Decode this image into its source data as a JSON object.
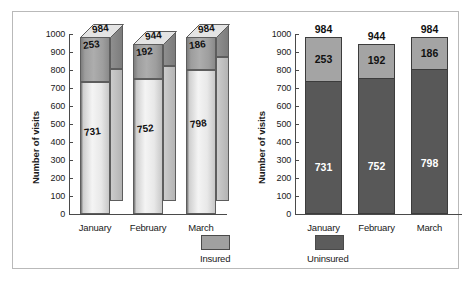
{
  "chart_data": [
    {
      "type": "bar",
      "title": "",
      "style": "3d-stacked-column",
      "xlabel": "",
      "ylabel": "Number of visits",
      "ylim": [
        0,
        1000
      ],
      "ytick_step": 100,
      "yticks": [
        "1000",
        "900",
        "800",
        "700",
        "600",
        "500",
        "400",
        "300",
        "200",
        "100",
        "0"
      ],
      "categories": [
        "January",
        "February",
        "March"
      ],
      "grid": false,
      "legend": {
        "position": "bottom-right",
        "entries": [
          "Insured"
        ]
      },
      "series": [
        {
          "name": "Uninsured",
          "values": [
            731,
            752,
            798
          ],
          "color": "#e8e8e8"
        },
        {
          "name": "Insured",
          "values": [
            253,
            192,
            186
          ],
          "color": "#a0a0a0"
        }
      ],
      "totals": [
        984,
        944,
        984
      ]
    },
    {
      "type": "bar",
      "title": "",
      "style": "flat-stacked-column",
      "xlabel": "",
      "ylabel": "Number of visits",
      "ylim": [
        0,
        1000
      ],
      "ytick_step": 100,
      "yticks": [
        "1000",
        "900",
        "800",
        "700",
        "600",
        "500",
        "400",
        "300",
        "200",
        "100",
        "0"
      ],
      "categories": [
        "January",
        "February",
        "March"
      ],
      "grid": false,
      "legend": {
        "position": "bottom-left",
        "entries": [
          "Uninsured"
        ]
      },
      "series": [
        {
          "name": "Uninsured",
          "values": [
            731,
            752,
            798
          ],
          "color": "#585858"
        },
        {
          "name": "Insured",
          "values": [
            253,
            192,
            186
          ],
          "color": "#a4a4a4"
        }
      ],
      "totals": [
        984,
        944,
        984
      ]
    }
  ],
  "left_chart": {
    "ylabel": "Number of visits",
    "yticks": [
      "1000",
      "900",
      "800",
      "700",
      "600",
      "500",
      "400",
      "300",
      "200",
      "100",
      "0"
    ],
    "categories": [
      "January",
      "February",
      "March"
    ],
    "bars": [
      {
        "month": "January",
        "total": "984",
        "insured": "253",
        "uninsured": "731"
      },
      {
        "month": "February",
        "total": "944",
        "insured": "192",
        "uninsured": "752"
      },
      {
        "month": "March",
        "total": "984",
        "insured": "186",
        "uninsured": "798"
      }
    ],
    "legend_label": "Insured"
  },
  "right_chart": {
    "ylabel": "Number of visits",
    "yticks": [
      "1000",
      "900",
      "800",
      "700",
      "600",
      "500",
      "400",
      "300",
      "200",
      "100",
      "0"
    ],
    "categories": [
      "January",
      "February",
      "March"
    ],
    "bars": [
      {
        "month": "January",
        "total": "984",
        "insured": "253",
        "uninsured": "731"
      },
      {
        "month": "February",
        "total": "944",
        "insured": "192",
        "uninsured": "752"
      },
      {
        "month": "March",
        "total": "984",
        "insured": "186",
        "uninsured": "798"
      }
    ],
    "legend_label": "Uninsured"
  },
  "colors": {
    "insured_flat": "#a4a4a4",
    "uninsured_flat": "#585858",
    "insured_swatch": "#a0a0a0",
    "uninsured_swatch": "#5c5c5c",
    "frame_border": "#b9b9b9",
    "axis": "#4a4a4a"
  }
}
